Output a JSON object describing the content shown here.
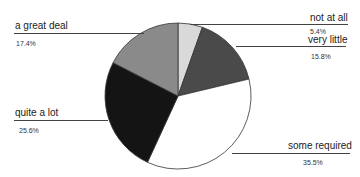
{
  "chart_data": {
    "type": "pie",
    "title": "",
    "start_angle_deg": 0,
    "direction": "clockwise",
    "slices": [
      {
        "label": "not at all",
        "percent": 5.4,
        "value": 5.4,
        "color": "#d9d9d9"
      },
      {
        "label": "very little",
        "percent": 15.8,
        "value": 15.8,
        "color": "#4a4a4a"
      },
      {
        "label": "some required",
        "percent": 35.5,
        "value": 35.5,
        "color": "#ffffff"
      },
      {
        "label": "quite a lot",
        "percent": 25.6,
        "value": 25.6,
        "color": "#141414"
      },
      {
        "label": "a great deal",
        "percent": 17.4,
        "value": 17.4,
        "color": "#8a8a8a"
      }
    ],
    "legend": "none",
    "labels_position": "callout lines"
  },
  "labels": {
    "not_at_all": {
      "name": "not at all",
      "pct": "5.4%"
    },
    "very_little": {
      "name": "very little",
      "pct": "15.8%"
    },
    "some_required": {
      "name": "some required",
      "pct": "35.5%"
    },
    "quite_a_lot": {
      "name": "quite a lot",
      "pct": "25.6%"
    },
    "a_great_deal": {
      "name": "a great deal",
      "pct": "17.4%"
    }
  }
}
